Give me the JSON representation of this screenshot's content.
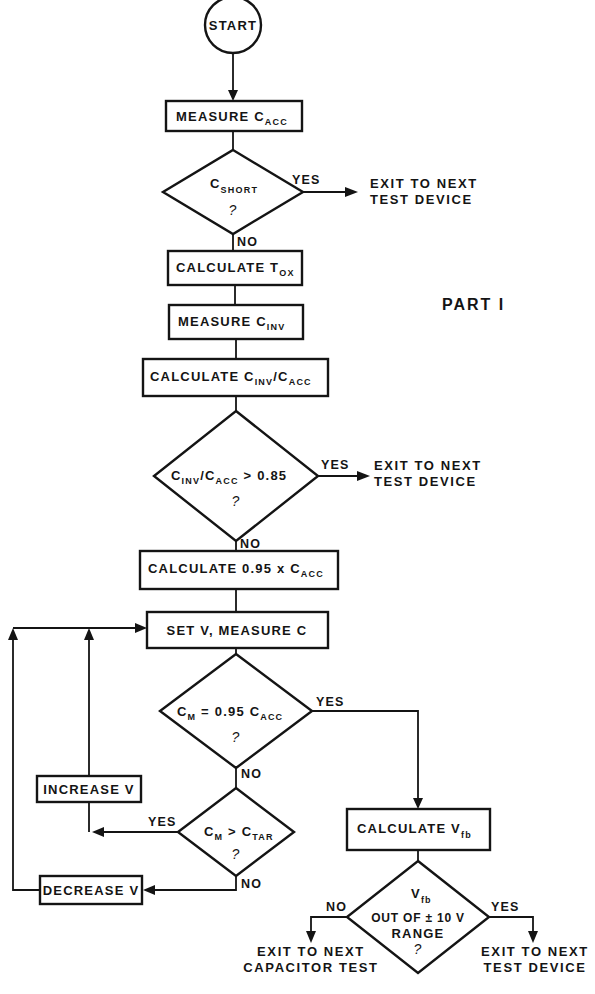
{
  "figure": {
    "part_label": "PART I",
    "start": {
      "label": "START"
    },
    "steps": {
      "measure_cacc": {
        "main": "MEASURE C",
        "sub": "ACC"
      },
      "calc_tox": {
        "main": "CALCULATE T",
        "sub": "OX"
      },
      "measure_cinv": {
        "main": "MEASURE C",
        "sub": "INV"
      },
      "calc_ratio": {
        "main": "CALCULATE C",
        "sub1": "INV",
        "mid": "/C",
        "sub2": "ACC"
      },
      "calc_095": {
        "main": "CALCULATE 0.95 x C",
        "sub": "ACC"
      },
      "set_v": {
        "main": "SET V, MEASURE C"
      },
      "increase_v": {
        "main": "INCREASE V"
      },
      "decrease_v": {
        "main": "DECREASE V"
      },
      "calc_vfb": {
        "main": "CALCULATE V",
        "sub": "fb"
      }
    },
    "decisions": {
      "cshort": {
        "main": "C",
        "sub": "SHORT",
        "q": "?"
      },
      "ratio": {
        "c1": "C",
        "sub1": "INV",
        "mid": "/C",
        "sub2": "ACC",
        "tail": " > 0.85",
        "q": "?"
      },
      "cm_eq": {
        "c1": "C",
        "sub1": "M",
        "mid": " = 0.95 C",
        "sub2": "ACC",
        "q": "?"
      },
      "cm_gt": {
        "c1": "C",
        "sub1": "M",
        "mid": " > C",
        "sub2": "TAR",
        "q": "?"
      },
      "vfb_range": {
        "line0": "V",
        "sub0": "fb",
        "line1": "OUT OF ± 10 V",
        "line2": "RANGE",
        "q": "?"
      }
    },
    "branch_labels": {
      "yes": "YES",
      "no": "NO"
    },
    "exits": {
      "exit1": {
        "line1": "EXIT TO NEXT",
        "line2": "TEST DEVICE"
      },
      "exit2": {
        "line1": "EXIT TO NEXT",
        "line2": "TEST DEVICE"
      },
      "exit_capacitor": {
        "line1": "EXIT TO NEXT",
        "line2": "CAPACITOR TEST"
      },
      "exit_device": {
        "line1": "EXIT TO NEXT",
        "line2": "TEST DEVICE"
      }
    },
    "colors": {
      "ink": "#141414",
      "paper": "#ffffff"
    }
  }
}
